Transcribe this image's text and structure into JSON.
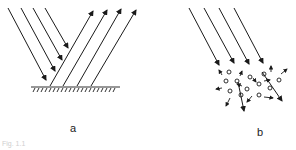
{
  "figure": {
    "panels": [
      {
        "id": "a",
        "label": "a",
        "description": "Specular reflection: parallel incident rays reflecting off a smooth hatched surface",
        "incident_rays": 4,
        "reflected_rays": 4
      },
      {
        "id": "b",
        "label": "b",
        "description": "Scattering: parallel incident rays entering a cluster of particles, scattered arrows in random directions",
        "incident_rays": 4,
        "particles": 14
      }
    ],
    "caption": "Fig. 1.1",
    "colors": {
      "ink": "#1a1a1a",
      "background": "#ffffff"
    }
  }
}
